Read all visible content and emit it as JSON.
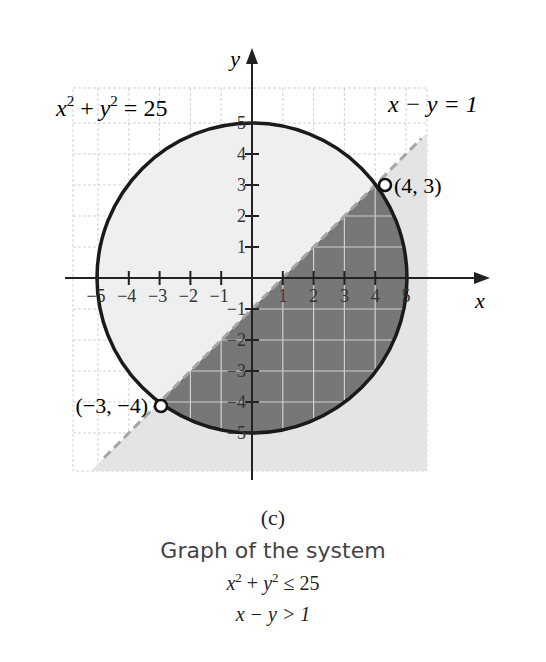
{
  "chart_data": {
    "type": "region",
    "title": "Graph of the system",
    "panel_label": "(c)",
    "xlabel": "x",
    "ylabel": "y",
    "xlim": [
      -5.5,
      5.5
    ],
    "ylim": [
      -6.2,
      6.2
    ],
    "grid": true,
    "x_ticks": [
      -5,
      -4,
      -3,
      -2,
      -1,
      1,
      2,
      3,
      4,
      5
    ],
    "y_ticks": [
      -5,
      -4,
      -3,
      -2,
      -1,
      1,
      2,
      3,
      4,
      5
    ],
    "curves": [
      {
        "name": "x^2 + y^2 = 25",
        "kind": "circle",
        "center": [
          0,
          0
        ],
        "radius": 5,
        "style": "solid"
      },
      {
        "name": "x - y = 1",
        "kind": "line",
        "slope": 1,
        "intercept": -1,
        "style": "dashed"
      }
    ],
    "shaded_regions": [
      {
        "description": "x - y > 1 (half-plane below the line)",
        "shade": "light"
      },
      {
        "description": "x^2 + y^2 <= 25 and x - y > 1 (solution set)",
        "shade": "dark"
      }
    ],
    "points": [
      {
        "label": "(4, 3)",
        "x": 4,
        "y": 3,
        "open": true
      },
      {
        "label": "(-3, -4)",
        "x": -3,
        "y": -4,
        "open": true
      }
    ],
    "annotations": [
      "x² + y² = 25",
      "x − y = 1"
    ]
  },
  "labels": {
    "y_axis": "y",
    "x_axis": "x",
    "circle_eq": {
      "base1": "x",
      "exp1": "2",
      "plus": " + ",
      "base2": "y",
      "exp2": "2",
      "rest": " = 25"
    },
    "line_eq": "x − y = 1",
    "point_a": "(4, 3)",
    "point_b": "(−3, −4)",
    "x_tick_labels": [
      "−5",
      "−4",
      "−3",
      "−2",
      "−1",
      "1",
      "2",
      "3",
      "4",
      "5"
    ],
    "y_tick_labels": [
      "5",
      "4",
      "3",
      "2",
      "1",
      "−1",
      "−2",
      "−3",
      "−4",
      "−5"
    ]
  },
  "caption": {
    "panel": "(c)",
    "title": "Graph of the system",
    "ineq1": {
      "base1": "x",
      "exp1": "2",
      "plus": " + ",
      "base2": "y",
      "exp2": "2",
      "rest": " ≤ 25"
    },
    "ineq2": "x − y > 1"
  },
  "colors": {
    "light_shade": "#e6e6e6",
    "dark_shade": "#7a7a7a",
    "grid": "#d0d0d0",
    "axis": "#222222",
    "dashed_line": "#a8a8a8"
  }
}
